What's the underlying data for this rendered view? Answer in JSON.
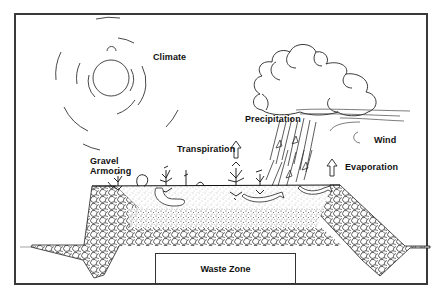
{
  "diagram": {
    "type": "landfill-cover-cross-section",
    "labels": {
      "climate": "Climate",
      "precipitation": "Precipitation",
      "wind": "Wind",
      "transpiration": "Transpiration",
      "evaporation": "Evaporation",
      "gravel_armoring_line1": "Gravel",
      "gravel_armoring_line2": "Armoring",
      "waste_zone": "Waste Zone"
    },
    "colors": {
      "line": "#222222",
      "frame": "#3a3a3a",
      "background": "#ffffff",
      "stipple": "#555555"
    }
  }
}
